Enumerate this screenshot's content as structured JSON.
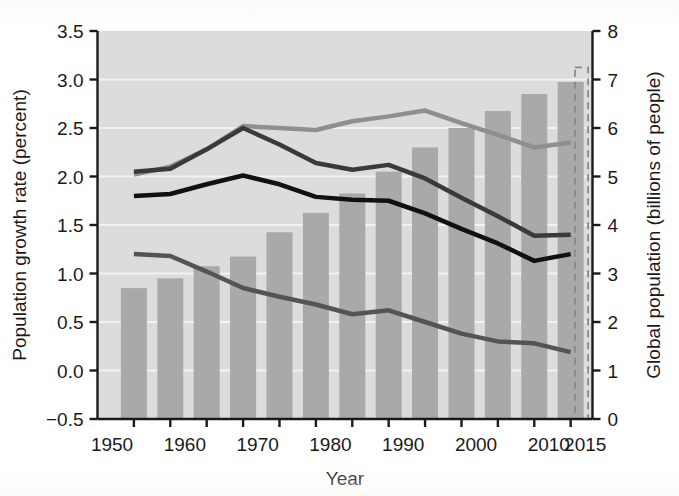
{
  "chart_data": {
    "type": "bar",
    "title": "",
    "subtitle": "",
    "xlabel": "Year",
    "ylabel": "Population growth rate (percent)",
    "y2label": "Global population (billions of people)",
    "xlim": [
      1948,
      2016
    ],
    "ylim": [
      -0.5,
      3.5
    ],
    "y2lim": [
      0,
      8
    ],
    "grid": true,
    "legend": "none",
    "x_tick_labels": [
      "1950",
      "1960",
      "1970",
      "1980",
      "1990",
      "2000",
      "2010",
      "2015"
    ],
    "x_tick_values": [
      1950,
      1960,
      1970,
      1980,
      1990,
      2000,
      2010,
      2015
    ],
    "y_tick_labels": [
      "3.5",
      "3.0",
      "2.5",
      "2.0",
      "1.5",
      "1.0",
      "0.5",
      "0.0",
      "−0.5"
    ],
    "y_tick_values": [
      3.5,
      3.0,
      2.5,
      2.0,
      1.5,
      1.0,
      0.5,
      0.0,
      -0.5
    ],
    "y2_tick_labels": [
      "8",
      "7",
      "6",
      "5",
      "4",
      "3",
      "2",
      "1",
      "0"
    ],
    "y2_tick_values": [
      8,
      7,
      6,
      5,
      4,
      3,
      2,
      1,
      0
    ],
    "bars": {
      "name": "Global population",
      "axis": "right",
      "unit": "billions of people",
      "color": "#a9a9a9",
      "categories": [
        1953,
        1958,
        1963,
        1968,
        1973,
        1978,
        1983,
        1988,
        1993,
        1998,
        2003,
        2008,
        2013
      ],
      "values": [
        2.7,
        2.9,
        3.15,
        3.35,
        3.85,
        4.25,
        4.65,
        5.1,
        5.6,
        6.0,
        6.35,
        6.7,
        6.95
      ]
    },
    "projection_box": {
      "name": "2015 projection",
      "style": "dashed",
      "color": "#8a8a8a",
      "x_start": 2013.6,
      "x_end": 2015.4,
      "value": 7.25,
      "axis": "right"
    },
    "series": [
      {
        "name": "Upper growth variant",
        "axis": "left",
        "color": "#8f8f8f",
        "width": 4.5,
        "x": [
          1953,
          1958,
          1963,
          1968,
          1973,
          1978,
          1983,
          1988,
          1993,
          1998,
          2003,
          2008,
          2013
        ],
        "values": [
          2.02,
          2.1,
          2.28,
          2.52,
          2.5,
          2.48,
          2.57,
          2.62,
          2.68,
          2.55,
          2.43,
          2.3,
          2.35
        ]
      },
      {
        "name": "Medium growth variant",
        "axis": "left",
        "color": "#3a3a3a",
        "width": 4.5,
        "x": [
          1953,
          1958,
          1963,
          1968,
          1973,
          1978,
          1983,
          1988,
          1993,
          1998,
          2003,
          2008,
          2013
        ],
        "values": [
          2.05,
          2.08,
          2.28,
          2.5,
          2.33,
          2.14,
          2.07,
          2.12,
          1.98,
          1.78,
          1.59,
          1.39,
          1.4
        ]
      },
      {
        "name": "Observed growth rate",
        "axis": "left",
        "color": "#111111",
        "width": 4.5,
        "x": [
          1953,
          1958,
          1963,
          1968,
          1973,
          1978,
          1983,
          1988,
          1993,
          1998,
          2003,
          2008,
          2013
        ],
        "values": [
          1.8,
          1.82,
          1.92,
          2.01,
          1.92,
          1.79,
          1.76,
          1.75,
          1.62,
          1.46,
          1.31,
          1.13,
          1.2
        ]
      },
      {
        "name": "Low growth variant",
        "axis": "left",
        "color": "#545454",
        "width": 4.5,
        "x": [
          1953,
          1958,
          1963,
          1968,
          1973,
          1978,
          1983,
          1988,
          1993,
          1998,
          2003,
          2008,
          2013
        ],
        "values": [
          1.2,
          1.18,
          1.02,
          0.85,
          0.76,
          0.68,
          0.58,
          0.62,
          0.5,
          0.38,
          0.3,
          0.28,
          0.19
        ]
      }
    ],
    "colors": {
      "plot_background": "#dcdcdc",
      "gridline": "#f2f2f2",
      "axis": "#1a1a1a",
      "page_background": "#ffffff"
    }
  }
}
